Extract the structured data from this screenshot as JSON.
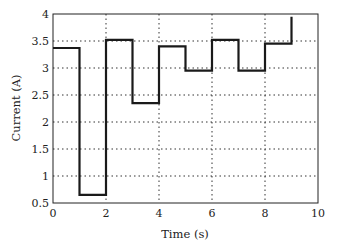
{
  "chart_data": {
    "type": "line",
    "subtype": "step",
    "title": "",
    "xlabel": "Time (s)",
    "ylabel": "Current (A)",
    "xlim": [
      0,
      10
    ],
    "ylim": [
      0.5,
      4
    ],
    "xticks": [
      0,
      2,
      4,
      6,
      8,
      10
    ],
    "yticks": [
      0.5,
      1,
      1.5,
      2,
      2.5,
      3,
      3.5,
      4
    ],
    "xtick_labels": [
      "0",
      "2",
      "4",
      "6",
      "8",
      "10"
    ],
    "ytick_labels": [
      "0.5",
      "1",
      "1.5",
      "2",
      "2.5",
      "3",
      "3.5",
      "4"
    ],
    "grid": true,
    "legend": null,
    "series": [
      {
        "name": "Current",
        "color": "#1a1a1a",
        "x": [
          0,
          1,
          2,
          3,
          4,
          5,
          6,
          7,
          8,
          9
        ],
        "values": [
          3.37,
          0.65,
          3.52,
          2.35,
          3.4,
          2.95,
          3.52,
          2.95,
          3.45,
          3.95
        ]
      }
    ]
  }
}
